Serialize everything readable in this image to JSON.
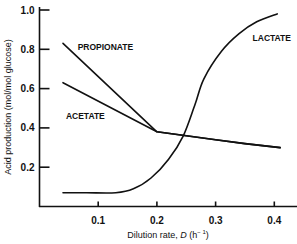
{
  "chart_data": {
    "type": "line",
    "title": "",
    "xlabel": "Dilution rate, D (h⁻¹)",
    "xlabel_parts": {
      "prefix": "Dilution rate, ",
      "var": "D",
      "unit_open": " (h",
      "unit_sup": "− 1",
      "unit_close": ")"
    },
    "ylabel": "Acid production (mol/mol glucose)",
    "xlim": [
      0,
      0.44
    ],
    "ylim": [
      0,
      1.0
    ],
    "x_ticks": [
      0.1,
      0.2,
      0.3,
      0.4
    ],
    "x_tick_labels": [
      "0.1",
      "0.2",
      "0.3",
      "0.4"
    ],
    "y_ticks": [
      0.2,
      0.4,
      0.6,
      0.8,
      1.0
    ],
    "y_tick_labels": [
      "0.2",
      "0.4",
      "0.6",
      "0.8",
      "1.0"
    ],
    "grid": false,
    "legend": "inline labels",
    "series": [
      {
        "name": "PROPIONATE",
        "x": [
          0.04,
          0.2,
          0.25,
          0.3,
          0.35,
          0.41
        ],
        "y": [
          0.83,
          0.38,
          0.36,
          0.34,
          0.32,
          0.3
        ],
        "label_pos": {
          "x": 0.065,
          "y": 0.81
        }
      },
      {
        "name": "ACETATE",
        "x": [
          0.04,
          0.2,
          0.25,
          0.3,
          0.35,
          0.41
        ],
        "y": [
          0.63,
          0.38,
          0.36,
          0.34,
          0.32,
          0.3
        ],
        "label_pos": {
          "x": 0.045,
          "y": 0.46
        }
      },
      {
        "name": "LACTATE",
        "x": [
          0.04,
          0.08,
          0.13,
          0.16,
          0.19,
          0.22,
          0.245,
          0.265,
          0.28,
          0.31,
          0.34,
          0.37,
          0.405
        ],
        "y": [
          0.07,
          0.07,
          0.07,
          0.09,
          0.145,
          0.24,
          0.36,
          0.52,
          0.65,
          0.79,
          0.88,
          0.94,
          0.98
        ],
        "label_pos": {
          "x": 0.363,
          "y": 0.86
        }
      }
    ]
  }
}
